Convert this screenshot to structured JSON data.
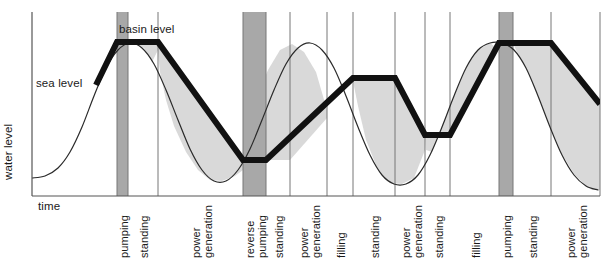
{
  "figure": {
    "axes": {
      "ylabel": "water level",
      "xlabel": "time"
    },
    "curve_labels": {
      "sea_level": "sea level",
      "basin_level": "basin level"
    },
    "caption": "",
    "colors": {
      "basin_line": "#111111",
      "sea_line": "#2a2a2a",
      "axis": "#555555",
      "divider": "#777777",
      "fill_light": "#d9d9d9",
      "fill_dark": "#a8a8a8",
      "background": "#ffffff"
    }
  },
  "chart_data": {
    "type": "line",
    "title": "",
    "xlabel": "time",
    "ylabel": "water level",
    "grid": false,
    "legend": "inline-annotations",
    "axis_ranges": {
      "x_pixels": [
        32,
        600
      ],
      "y_pixels": [
        12,
        196
      ],
      "note": "axes are unlabeled/qualitative; no numeric ticks shown"
    },
    "series": [
      {
        "name": "sea level",
        "style": "thin",
        "description": "smooth sinusoidal tide curve with roughly four crests across the time axis"
      },
      {
        "name": "basin level",
        "style": "thick",
        "description": "piecewise-linear impounded basin level with flat plateaus during standing phases and sloped segments during pumping, filling and power generation"
      }
    ],
    "phases": [
      {
        "index": 1,
        "label": "pumping",
        "type": "pumping",
        "x_start": 117,
        "x_end": 128,
        "shaded": true
      },
      {
        "index": 2,
        "label": "standing",
        "type": "standing",
        "x_start": 128,
        "x_end": 158,
        "shaded": false
      },
      {
        "index": 3,
        "label": "power generation",
        "type": "power generation",
        "x_start": 158,
        "x_end": 243,
        "shaded": false
      },
      {
        "index": 4,
        "label": "reverse pumping",
        "type": "reverse pumping",
        "x_start": 243,
        "x_end": 266,
        "shaded": true
      },
      {
        "index": 5,
        "label": "standing",
        "type": "standing",
        "x_start": 266,
        "x_end": 290,
        "shaded": false
      },
      {
        "index": 6,
        "label": "power generation",
        "type": "power generation",
        "x_start": 290,
        "x_end": 327,
        "shaded": false
      },
      {
        "index": 7,
        "label": "filling",
        "type": "filling",
        "x_start": 327,
        "x_end": 353,
        "shaded": false
      },
      {
        "index": 8,
        "label": "standing",
        "type": "standing",
        "x_start": 353,
        "x_end": 395,
        "shaded": false
      },
      {
        "index": 9,
        "label": "power generation",
        "type": "power generation",
        "x_start": 395,
        "x_end": 425,
        "shaded": false
      },
      {
        "index": 10,
        "label": "standing",
        "type": "standing",
        "x_start": 425,
        "x_end": 450,
        "shaded": false
      },
      {
        "index": 11,
        "label": "filling",
        "type": "filling",
        "x_start": 450,
        "x_end": 499,
        "shaded": false
      },
      {
        "index": 12,
        "label": "pumping",
        "type": "pumping",
        "x_start": 499,
        "x_end": 513,
        "shaded": true
      },
      {
        "index": 13,
        "label": "standing",
        "type": "standing",
        "x_start": 513,
        "x_end": 551,
        "shaded": false
      },
      {
        "index": 14,
        "label": "power generation",
        "type": "power generation",
        "x_start": 551,
        "x_end": 600,
        "shaded": false
      }
    ],
    "phase_labels": [
      "pumping",
      "standing",
      "power generation",
      "reverse pumping",
      "standing",
      "power generation",
      "filling",
      "standing",
      "power generation",
      "standing",
      "filling",
      "pumping",
      "standing",
      "power generation"
    ],
    "basin_level_points": [
      [
        96,
        85
      ],
      [
        117,
        42
      ],
      [
        158,
        42
      ],
      [
        243,
        160
      ],
      [
        266,
        160
      ],
      [
        353,
        78
      ],
      [
        395,
        78
      ],
      [
        425,
        135
      ],
      [
        450,
        135
      ],
      [
        499,
        43
      ],
      [
        551,
        43
      ],
      [
        600,
        104
      ]
    ],
    "sea_level_points": [
      [
        32,
        178
      ],
      [
        45,
        176
      ],
      [
        58,
        168
      ],
      [
        70,
        152
      ],
      [
        82,
        127
      ],
      [
        94,
        96
      ],
      [
        106,
        68
      ],
      [
        118,
        50
      ],
      [
        130,
        43
      ],
      [
        142,
        48
      ],
      [
        154,
        64
      ],
      [
        166,
        90
      ],
      [
        178,
        120
      ],
      [
        190,
        149
      ],
      [
        202,
        170
      ],
      [
        214,
        181
      ],
      [
        226,
        181
      ],
      [
        238,
        170
      ],
      [
        250,
        149
      ],
      [
        262,
        120
      ],
      [
        274,
        90
      ],
      [
        286,
        64
      ],
      [
        298,
        48
      ],
      [
        310,
        43
      ],
      [
        322,
        50
      ],
      [
        334,
        68
      ],
      [
        346,
        96
      ],
      [
        358,
        127
      ],
      [
        370,
        155
      ],
      [
        382,
        175
      ],
      [
        394,
        184
      ],
      [
        406,
        184
      ],
      [
        418,
        175
      ],
      [
        430,
        155
      ],
      [
        442,
        127
      ],
      [
        454,
        96
      ],
      [
        466,
        68
      ],
      [
        478,
        50
      ],
      [
        490,
        43
      ],
      [
        502,
        43
      ],
      [
        514,
        50
      ],
      [
        526,
        68
      ],
      [
        538,
        96
      ],
      [
        550,
        127
      ],
      [
        562,
        155
      ],
      [
        574,
        175
      ],
      [
        586,
        186
      ],
      [
        598,
        190
      ]
    ]
  }
}
